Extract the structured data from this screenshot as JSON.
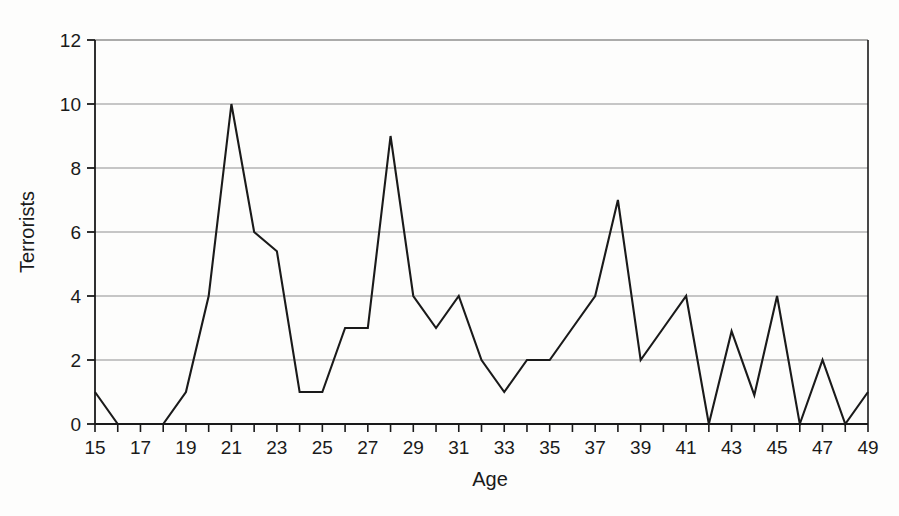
{
  "chart_data": {
    "type": "line",
    "title": "",
    "xlabel": "Age",
    "ylabel": "Terrorists",
    "xlim": [
      15,
      49
    ],
    "ylim": [
      0,
      12
    ],
    "xtick_step": 1,
    "xtick_label_step": 2,
    "ytick_step": 2,
    "grid": "horizontal",
    "legend": "none",
    "line_color": "#1a1a1a",
    "grid_color": "#8f8f8f",
    "axis_color": "#1a1a1a",
    "background_color": "#fdfdfc",
    "x": [
      15,
      16,
      17,
      18,
      19,
      20,
      21,
      22,
      23,
      24,
      25,
      26,
      27,
      28,
      29,
      30,
      31,
      32,
      33,
      34,
      35,
      36,
      37,
      38,
      39,
      40,
      41,
      42,
      43,
      44,
      45,
      46,
      47,
      48,
      49
    ],
    "values": [
      1,
      0,
      0,
      0,
      1,
      4,
      10,
      6,
      5.4,
      1,
      1,
      3,
      3,
      9,
      4,
      3,
      4,
      2,
      1,
      2,
      2,
      3,
      4,
      7,
      2,
      3,
      4,
      0,
      2.9,
      0.9,
      4,
      0,
      2,
      0,
      1
    ],
    "xticks": [
      15,
      16,
      17,
      18,
      19,
      20,
      21,
      22,
      23,
      24,
      25,
      26,
      27,
      28,
      29,
      30,
      31,
      32,
      33,
      34,
      35,
      36,
      37,
      38,
      39,
      40,
      41,
      42,
      43,
      44,
      45,
      46,
      47,
      48,
      49
    ],
    "xtick_labels": [
      "15",
      "",
      "17",
      "",
      "19",
      "",
      "21",
      "",
      "23",
      "",
      "25",
      "",
      "27",
      "",
      "29",
      "",
      "31",
      "",
      "33",
      "",
      "35",
      "",
      "37",
      "",
      "39",
      "",
      "41",
      "",
      "43",
      "",
      "45",
      "",
      "47",
      "",
      "49"
    ],
    "yticks": [
      0,
      2,
      4,
      6,
      8,
      10,
      12
    ],
    "ytick_labels": [
      "0",
      "2",
      "4",
      "6",
      "8",
      "10",
      "12"
    ]
  }
}
